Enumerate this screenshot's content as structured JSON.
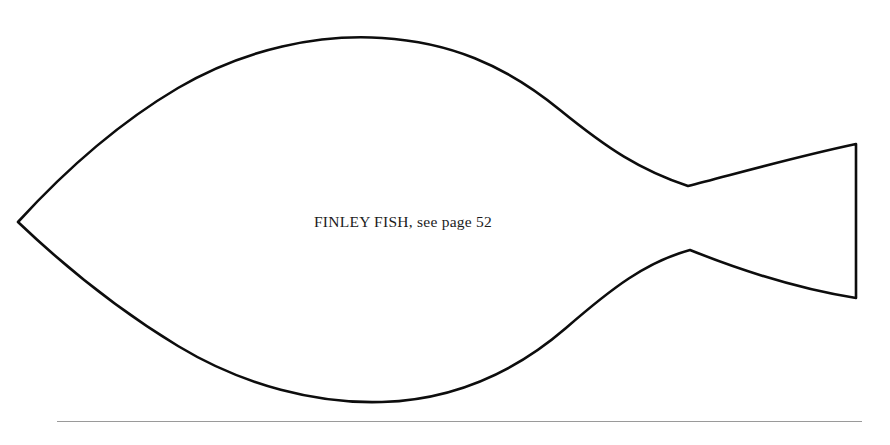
{
  "page": {
    "background_color": "#ffffff",
    "width": 890,
    "height": 445
  },
  "artwork": {
    "name": "finley-fish-outline",
    "description": "Fish body template outline with pointed nose and flared fan tail",
    "stroke_color": "#0d0d0d",
    "fill_color": "#ffffff",
    "stroke_width": 2.6,
    "key_points": {
      "nose_tip": [
        18,
        222
      ],
      "body_top_peak": [
        380,
        38
      ],
      "body_bottom_peak": [
        380,
        402
      ],
      "waist_top": [
        688,
        186
      ],
      "waist_bottom": [
        690,
        250
      ],
      "tail_top_right": [
        856,
        144
      ],
      "tail_bottom_right": [
        857,
        298
      ]
    },
    "path": "M 18 222 C 60 176 112 127 178 88 C 246 48 320 34 382 38 C 448 42 504 64 560 110 C 608 149 640 170 688 186 C 728 176 790 158 856 144 L 856 298 C 792 288 730 266 690 250 C 646 262 612 288 566 328 C 508 378 446 400 382 402 C 318 404 244 386 178 346 C 112 306 60 262 18 222 Z"
  },
  "caption": {
    "text": "FINLEY FISH, see page 52",
    "title_part": "FINLEY FISH,",
    "reference_part": "see page 52",
    "color": "#1b1b1b",
    "font_size_px": 15.5,
    "position": [
      319,
      225
    ]
  },
  "rule": {
    "name": "bottom-divider",
    "color": "#9a9a9a",
    "x_start": 57,
    "x_end": 862,
    "y": 421,
    "thickness_px": 1
  }
}
